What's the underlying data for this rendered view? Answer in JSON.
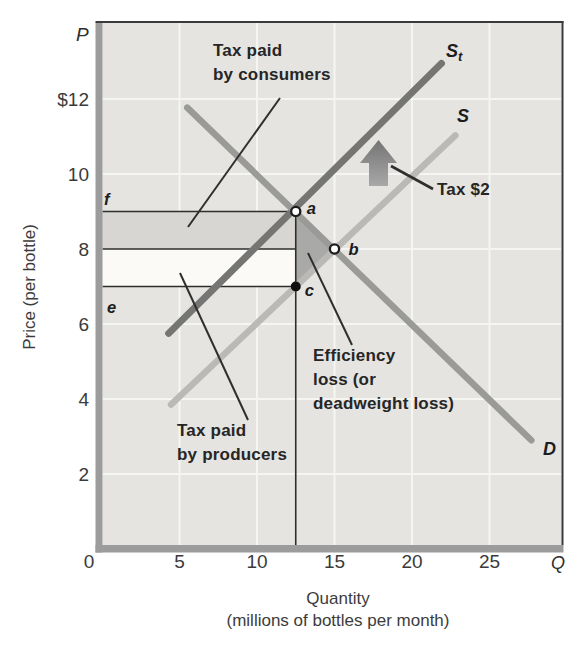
{
  "figure": {
    "background": "#ffffff",
    "plot_bg": "#e5e4e1",
    "frame_band_color": "#9c9c9c",
    "frame_edge_color": "#3a3a3a",
    "grid_color": "#f5f5f2",
    "guide_line_color": "#2e2e2e",
    "pointer_color": "#2f2f2f",
    "arrow_color_top": "#747474",
    "arrow_color_bottom": "#a8a8a8"
  },
  "chart_data": {
    "type": "line",
    "title": "",
    "xlabel": "Quantity",
    "xlabel_sub": "(millions of bottles per month)",
    "ylabel": "Price (per bottle)",
    "x_axis_symbol": "Q",
    "y_axis_symbol": "P",
    "xlim": [
      0,
      29.5
    ],
    "ylim": [
      0,
      14
    ],
    "grid": true,
    "x_ticks": [
      {
        "label": "0",
        "q": 0
      },
      {
        "label": "5",
        "q": 5
      },
      {
        "label": "10",
        "q": 10
      },
      {
        "label": "15",
        "q": 15
      },
      {
        "label": "20",
        "q": 20
      },
      {
        "label": "25",
        "q": 25
      }
    ],
    "y_ticks": [
      {
        "label": "$12",
        "p": 12
      },
      {
        "label": "10",
        "p": 10
      },
      {
        "label": "8",
        "p": 8
      },
      {
        "label": "6",
        "p": 6
      },
      {
        "label": "4",
        "p": 4
      },
      {
        "label": "2",
        "p": 2
      }
    ],
    "series": [
      {
        "name": "supply-with-tax",
        "label": "S",
        "sub": "t",
        "points": [
          [
            4.3,
            5.75
          ],
          [
            21.9,
            12.95
          ]
        ],
        "color": "#757574",
        "width": 7
      },
      {
        "name": "supply",
        "label": "S",
        "sub": "",
        "points": [
          [
            4.45,
            3.85
          ],
          [
            22.8,
            11.03
          ]
        ],
        "color": "#bab9b6",
        "width": 6.5
      },
      {
        "name": "demand",
        "label": "D",
        "sub": "",
        "points": [
          [
            5.5,
            11.77
          ],
          [
            27.7,
            2.9
          ]
        ],
        "color": "#9a9a99",
        "width": 6.5
      }
    ],
    "key_points": [
      {
        "label": "a",
        "q": 12.5,
        "p": 9,
        "style": "open"
      },
      {
        "label": "b",
        "q": 15,
        "p": 8,
        "style": "open"
      },
      {
        "label": "c",
        "q": 12.5,
        "p": 7,
        "style": "filled"
      }
    ],
    "price_guides": [
      {
        "label": "f",
        "p": 9
      },
      {
        "label": "",
        "p": 8
      },
      {
        "label": "e",
        "p": 7
      }
    ],
    "quantity_guide": 12.5,
    "regions": [
      {
        "name": "tax-paid-by-consumers",
        "q0": 0,
        "q1": 12.5,
        "p0": 8,
        "p1": 9,
        "color": "#d7d6d2"
      },
      {
        "name": "tax-paid-by-producers",
        "q0": 0,
        "q1": 12.5,
        "p0": 7,
        "p1": 8,
        "color": "#fbfaf7"
      },
      {
        "name": "deadweight-loss-triangle",
        "points": [
          [
            12.5,
            9
          ],
          [
            15,
            8
          ],
          [
            12.5,
            7
          ]
        ],
        "color": "#a9a9a8"
      }
    ],
    "annotations": {
      "consumers": {
        "text": "Tax paid\nby consumers"
      },
      "producers": {
        "text": "Tax paid\nby producers"
      },
      "efficiency": {
        "text": "Efficiency\nloss (or\ndeadweight loss)"
      },
      "tax": {
        "text": "Tax $2"
      }
    },
    "tax_amount": "$2",
    "equilibrium_no_tax": {
      "q": 15,
      "p": 8
    },
    "equilibrium_with_tax": {
      "q": 12.5,
      "p_consumers": 9,
      "p_producers": 7
    }
  }
}
